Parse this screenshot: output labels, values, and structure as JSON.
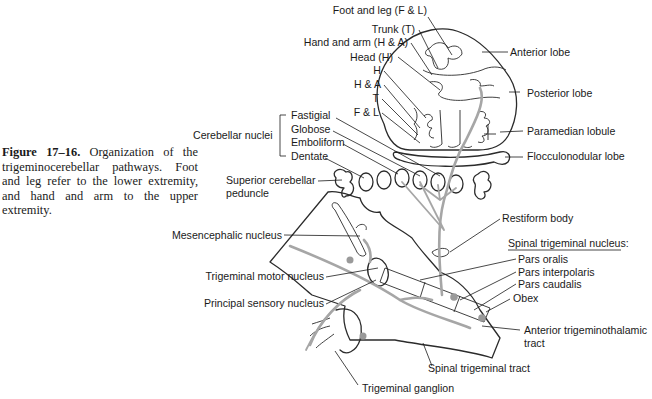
{
  "caption": {
    "figure_label": "Figure 17–16.",
    "text": "Organization of the trigeminocerebellar pathways. Foot and leg refer to the lower extremity, and hand and arm to the upper extremity."
  },
  "somatotopy_labels": {
    "foot_leg": "Foot and leg (F & L)",
    "trunk": "Trunk (T)",
    "hand_arm": "Hand and arm (H & A)",
    "head": "Head (H)",
    "h": "H",
    "h_a": "H & A",
    "t": "T",
    "f_l": "F & L"
  },
  "cerebellum_labels": {
    "anterior_lobe": "Anterior lobe",
    "posterior_lobe": "Posterior lobe",
    "paramedian_lobule": "Paramedian lobule",
    "flocculonodular_lobe": "Flocculonodular lobe"
  },
  "cerebellar_nuclei": {
    "group_label": "Cerebellar nuclei",
    "items": [
      "Fastigial",
      "Globose",
      "Emboliform",
      "Dentate"
    ]
  },
  "brainstem_labels": {
    "superior_cerebellar_peduncle_1": "Superior cerebellar",
    "superior_cerebellar_peduncle_2": "peduncle",
    "restiform_body": "Restiform body",
    "mesencephalic_nucleus": "Mesencephalic nucleus",
    "trigeminal_motor_nucleus": "Trigeminal motor nucleus",
    "principal_sensory_nucleus": "Principal sensory nucleus",
    "spinal_trigeminal_tract": "Spinal trigeminal tract",
    "trigeminal_ganglion": "Trigeminal ganglion",
    "obex": "Obex",
    "anterior_trigeminothalamic_1": "Anterior trigeminothalamic",
    "anterior_trigeminothalamic_2": "tract"
  },
  "spinal_trigeminal_nucleus": {
    "heading": "Spinal trigeminal nucleus:",
    "parts": [
      "Pars oralis",
      "Pars interpolaris",
      "Pars caudalis"
    ]
  },
  "colors": {
    "line": "#2b2b2b",
    "pathway": "#a6a6a6",
    "text": "#1a1a1a",
    "background": "#ffffff"
  }
}
